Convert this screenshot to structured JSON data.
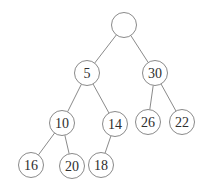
{
  "diagram": {
    "type": "binary-tree",
    "colors": {
      "background": "#ffffff",
      "node_fill": "#ffffff",
      "node_stroke": "#8a8a8a",
      "edge_stroke": "#8a8a8a",
      "label": "#2e2e2e"
    },
    "node_radius": 12.5,
    "nodes": [
      {
        "id": "root",
        "label": "",
        "x": 124,
        "y": 25
      },
      {
        "id": "n5",
        "label": "5",
        "x": 87,
        "y": 73
      },
      {
        "id": "n30",
        "label": "30",
        "x": 155,
        "y": 73
      },
      {
        "id": "n10",
        "label": "10",
        "x": 62,
        "y": 123
      },
      {
        "id": "n14",
        "label": "14",
        "x": 115,
        "y": 124
      },
      {
        "id": "n26",
        "label": "26",
        "x": 148,
        "y": 122
      },
      {
        "id": "n22",
        "label": "22",
        "x": 182,
        "y": 122
      },
      {
        "id": "n16",
        "label": "16",
        "x": 31,
        "y": 165
      },
      {
        "id": "n20",
        "label": "20",
        "x": 72,
        "y": 166
      },
      {
        "id": "n18",
        "label": "18",
        "x": 101,
        "y": 165
      }
    ],
    "edges": [
      {
        "from": "root",
        "to": "n5"
      },
      {
        "from": "root",
        "to": "n30"
      },
      {
        "from": "n5",
        "to": "n10"
      },
      {
        "from": "n5",
        "to": "n14"
      },
      {
        "from": "n30",
        "to": "n26"
      },
      {
        "from": "n30",
        "to": "n22"
      },
      {
        "from": "n10",
        "to": "n16"
      },
      {
        "from": "n10",
        "to": "n20"
      },
      {
        "from": "n14",
        "to": "n18"
      }
    ]
  }
}
